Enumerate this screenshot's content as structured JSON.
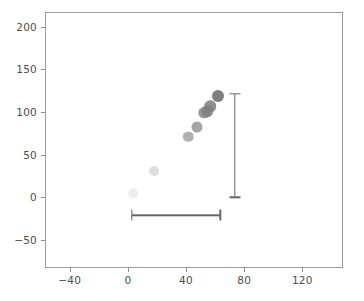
{
  "chart_data": {
    "type": "scatter",
    "title": "",
    "xlabel": "",
    "ylabel": "",
    "xlim": [
      -57,
      148
    ],
    "ylim": [
      -83,
      217
    ],
    "grid": false,
    "legend": null,
    "xticks": [
      -40,
      0,
      40,
      80,
      120
    ],
    "xticklabels": [
      "−40",
      "0",
      "40",
      "80",
      "120"
    ],
    "yticks": [
      -50,
      0,
      50,
      100,
      150,
      200
    ],
    "yticklabels": [
      "−50",
      "0",
      "50",
      "100",
      "150",
      "200"
    ],
    "series": [
      {
        "name": "points",
        "marker": "circle",
        "color": "#7f7f7f",
        "points": [
          {
            "x": 3,
            "y": 6,
            "size": 9.5,
            "alpha": 0.14,
            "color": "#7f7f7f"
          },
          {
            "x": 17,
            "y": 32,
            "size": 10.0,
            "alpha": 0.26,
            "color": "#7f7f7f"
          },
          {
            "x": 41,
            "y": 72,
            "size": 10.5,
            "alpha": 0.62,
            "color": "#7f7f7f"
          },
          {
            "x": 47,
            "y": 83,
            "size": 11.0,
            "alpha": 0.7,
            "color": "#7f7f7f"
          },
          {
            "x": 52,
            "y": 100,
            "size": 11.5,
            "alpha": 0.8,
            "color": "#7f7f7f"
          },
          {
            "x": 54,
            "y": 102,
            "size": 11.5,
            "alpha": 0.85,
            "color": "#7f7f7f"
          },
          {
            "x": 56,
            "y": 108,
            "size": 11.5,
            "alpha": 0.88,
            "color": "#7f7f7f"
          },
          {
            "x": 61,
            "y": 120,
            "size": 12.0,
            "alpha": 1.0,
            "color": "#7f7f7f"
          }
        ]
      }
    ],
    "error_bars": [
      {
        "name": "vertical-error-bar",
        "orientation": "vertical",
        "x": 73,
        "y_low": 1,
        "y_high": 122,
        "color": "#666666",
        "cap_size": 11
      },
      {
        "name": "horizontal-error-bar",
        "orientation": "horizontal",
        "y": -20,
        "x_low": 2,
        "x_high": 63,
        "color": "#666666",
        "cap_size": 11
      }
    ]
  }
}
